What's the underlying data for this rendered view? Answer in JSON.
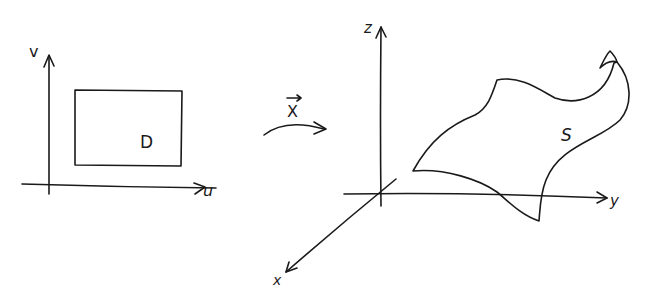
{
  "left_panel": {
    "axis_v_label": "v",
    "axis_u_label": "u",
    "domain_label": "D"
  },
  "mapping": {
    "label": "X",
    "has_vector_arrow": true
  },
  "right_panel": {
    "axis_z_label": "z",
    "axis_y_label": "y",
    "axis_x_label": "x",
    "surface_label": "S"
  },
  "colors": {
    "ink": "#1a1a1a",
    "background": "#ffffff"
  }
}
